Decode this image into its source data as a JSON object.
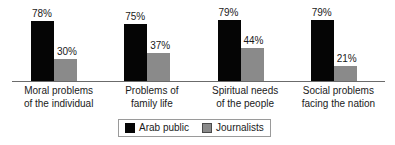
{
  "chart_data": {
    "type": "bar",
    "title": "",
    "subtitle": "",
    "xlabel": "",
    "ylabel": "",
    "ylim": [
      0,
      100
    ],
    "grid": false,
    "legend_position": "bottom-center",
    "value_suffix": "%",
    "categories": [
      "Moral problems of the individual",
      "Problems of family life",
      "Spiritual needs of the people",
      "Social problems facing the nation"
    ],
    "category_lines": [
      [
        "Moral problems",
        "of the individual"
      ],
      [
        "Problems of",
        "family life"
      ],
      [
        "Spiritual needs",
        "of the people"
      ],
      [
        "Social problems",
        "facing the nation"
      ]
    ],
    "series": [
      {
        "name": "Arab public",
        "color": "#050505",
        "values": [
          78,
          75,
          79,
          79
        ],
        "labels": [
          "78%",
          "75%",
          "79%",
          "79%"
        ]
      },
      {
        "name": "Journalists",
        "color": "#8a8a8a",
        "values": [
          30,
          37,
          44,
          21
        ],
        "labels": [
          "30%",
          "37%",
          "44%",
          "21%"
        ]
      }
    ]
  },
  "legend": {
    "entries": [
      {
        "label": "Arab public",
        "swatch": "black-square-icon"
      },
      {
        "label": "Journalists",
        "swatch": "gray-square-icon"
      }
    ]
  }
}
